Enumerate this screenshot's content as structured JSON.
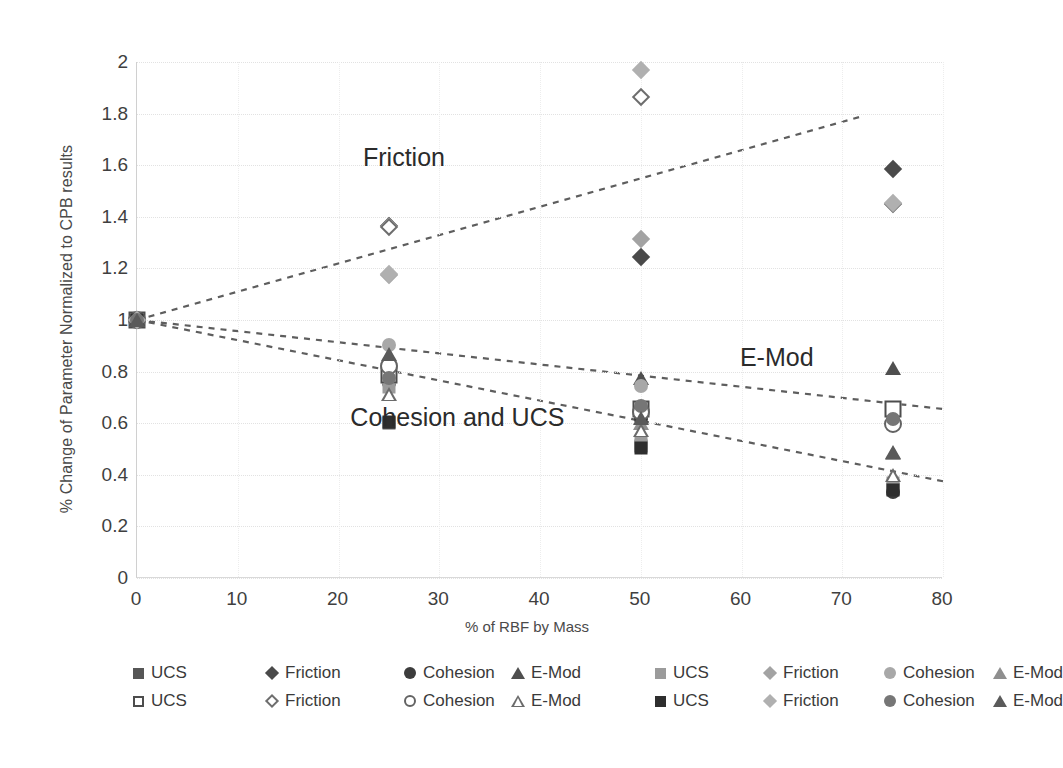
{
  "chart_data": {
    "type": "scatter",
    "title": "",
    "xlabel": "% of RBF by Mass",
    "ylabel": "% Change of Parameter Normalized to CPB results",
    "xlim": [
      0,
      80
    ],
    "ylim": [
      0,
      2
    ],
    "xticks": [
      0,
      10,
      20,
      30,
      40,
      50,
      60,
      70,
      80
    ],
    "yticks": [
      0,
      0.2,
      0.4,
      0.6,
      0.8,
      1,
      1.2,
      1.4,
      1.6,
      1.8,
      2
    ],
    "xtick_labels": [
      "0",
      "10",
      "20",
      "30",
      "40",
      "50",
      "60",
      "70",
      "80"
    ],
    "ytick_labels": [
      "0",
      "0.2",
      "0.4",
      "0.6",
      "0.8",
      "1",
      "1.2",
      "1.4",
      "1.6",
      "1.8",
      "2"
    ],
    "grid": true,
    "legend_position": "bottom",
    "annotations": [
      {
        "text": "Friction",
        "x": 26.5,
        "y": 1.63
      },
      {
        "text": "E-Mod",
        "x": 63.5,
        "y": 0.855
      },
      {
        "text": "Cohesion and UCS",
        "x": 31.8,
        "y": 0.625
      }
    ],
    "trendlines": [
      {
        "name": "Friction trend",
        "x": [
          0,
          72
        ],
        "y": [
          1.0,
          1.79
        ],
        "style": "dashed",
        "color": "#5e5e5e"
      },
      {
        "name": "E-Mod trend",
        "x": [
          0,
          80
        ],
        "y": [
          1.0,
          0.655
        ],
        "style": "dashed",
        "color": "#5e5e5e"
      },
      {
        "name": "Cohesion and UCS trend",
        "x": [
          0,
          80
        ],
        "y": [
          1.0,
          0.375
        ],
        "style": "dashed",
        "color": "#5e5e5e"
      }
    ],
    "series": [
      {
        "name": "UCS",
        "set": 1,
        "marker": "square",
        "fill": "filled",
        "color": "#565656",
        "x": [
          0,
          25,
          50,
          75
        ],
        "y": [
          1.0,
          0.6,
          0.51,
          0.345
        ]
      },
      {
        "name": "Friction",
        "set": 1,
        "marker": "diamond",
        "fill": "filled",
        "color": "#4a4a4a",
        "x": [
          0,
          25,
          50,
          75
        ],
        "y": [
          1.0,
          1.365,
          1.245,
          1.585
        ]
      },
      {
        "name": "Cohesion",
        "set": 1,
        "marker": "circle",
        "fill": "filled",
        "color": "#3c3c3c",
        "x": [
          0,
          25,
          50,
          75
        ],
        "y": [
          1.0,
          0.755,
          0.615,
          0.335
        ]
      },
      {
        "name": "E-Mod",
        "set": 1,
        "marker": "triangle",
        "fill": "filled",
        "color": "#4f4f4f",
        "x": [
          0,
          25,
          50,
          75
        ],
        "y": [
          1.0,
          0.855,
          0.775,
          0.815
        ]
      },
      {
        "name": "UCS",
        "set": 2,
        "marker": "square",
        "fill": "filled",
        "color": "#9b9b9b",
        "x": [
          0,
          25,
          50,
          75
        ],
        "y": [
          1.0,
          0.74,
          0.525,
          0.37
        ]
      },
      {
        "name": "Friction",
        "set": 2,
        "marker": "diamond",
        "fill": "filled",
        "color": "#a3a3a3",
        "x": [
          0,
          25,
          50,
          75
        ],
        "y": [
          1.0,
          1.175,
          1.315,
          1.45
        ]
      },
      {
        "name": "Cohesion",
        "set": 2,
        "marker": "circle",
        "fill": "filled",
        "color": "#a8a8a8",
        "x": [
          0,
          25,
          50,
          75
        ],
        "y": [
          1.0,
          0.905,
          0.745,
          0.625
        ]
      },
      {
        "name": "E-Mod",
        "set": 2,
        "marker": "triangle",
        "fill": "filled",
        "color": "#8f8f8f",
        "x": [
          0,
          25,
          50,
          75
        ],
        "y": [
          1.0,
          0.865,
          0.6,
          0.485
        ]
      },
      {
        "name": "UCS",
        "set": 3,
        "marker": "square",
        "fill": "open",
        "color": "#4d4d4d",
        "x": [
          0,
          25,
          50,
          75
        ],
        "y": [
          1.0,
          0.785,
          0.655,
          0.655
        ]
      },
      {
        "name": "Friction",
        "set": 3,
        "marker": "diamond",
        "fill": "open",
        "color": "#6e6e6e",
        "x": [
          0,
          25,
          50,
          75
        ],
        "y": [
          1.0,
          1.36,
          1.865,
          1.45
        ]
      },
      {
        "name": "Cohesion",
        "set": 3,
        "marker": "circle",
        "fill": "open",
        "color": "#636363",
        "x": [
          0,
          25,
          50,
          75
        ],
        "y": [
          1.0,
          0.82,
          0.645,
          0.595
        ]
      },
      {
        "name": "E-Mod",
        "set": 3,
        "marker": "triangle",
        "fill": "open",
        "color": "#6b6b6b",
        "x": [
          0,
          25,
          50,
          75
        ],
        "y": [
          1.0,
          0.715,
          0.575,
          0.4
        ]
      },
      {
        "name": "UCS",
        "set": 4,
        "marker": "square",
        "fill": "filled",
        "color": "#2e2e2e",
        "x": [
          0,
          25,
          50,
          75
        ],
        "y": [
          1.0,
          0.605,
          0.505,
          0.34
        ]
      },
      {
        "name": "Friction",
        "set": 4,
        "marker": "diamond",
        "fill": "filled",
        "color": "#b0b0b0",
        "x": [
          0,
          25,
          50,
          75
        ],
        "y": [
          1.0,
          1.18,
          1.97,
          1.455
        ]
      },
      {
        "name": "Cohesion",
        "set": 4,
        "marker": "circle",
        "fill": "filled",
        "color": "#767676",
        "x": [
          0,
          25,
          50,
          75
        ],
        "y": [
          1.0,
          0.775,
          0.665,
          0.615
        ]
      },
      {
        "name": "E-Mod",
        "set": 4,
        "marker": "triangle",
        "fill": "filled",
        "color": "#5a5a5a",
        "x": [
          0,
          25,
          50,
          75
        ],
        "y": [
          1.0,
          0.87,
          0.62,
          0.49
        ]
      }
    ],
    "legend": {
      "row1": [
        {
          "label": "UCS",
          "marker": "square",
          "fill": "filled",
          "color": "#565656"
        },
        {
          "label": "Friction",
          "marker": "diamond",
          "fill": "filled",
          "color": "#4a4a4a"
        },
        {
          "label": "Cohesion",
          "marker": "circle",
          "fill": "filled",
          "color": "#3c3c3c"
        },
        {
          "label": "E-Mod",
          "marker": "triangle",
          "fill": "filled",
          "color": "#4f4f4f"
        },
        {
          "label": "UCS",
          "marker": "square",
          "fill": "filled",
          "color": "#9b9b9b"
        },
        {
          "label": "Friction",
          "marker": "diamond",
          "fill": "filled",
          "color": "#a3a3a3"
        },
        {
          "label": "Cohesion",
          "marker": "circle",
          "fill": "filled",
          "color": "#a8a8a8"
        },
        {
          "label": "E-Mod",
          "marker": "triangle",
          "fill": "filled",
          "color": "#8f8f8f"
        }
      ],
      "row2": [
        {
          "label": "UCS",
          "marker": "square",
          "fill": "open",
          "color": "#4d4d4d"
        },
        {
          "label": "Friction",
          "marker": "diamond",
          "fill": "open",
          "color": "#6e6e6e"
        },
        {
          "label": "Cohesion",
          "marker": "circle",
          "fill": "open",
          "color": "#636363"
        },
        {
          "label": "E-Mod",
          "marker": "triangle",
          "fill": "open",
          "color": "#6b6b6b"
        },
        {
          "label": "UCS",
          "marker": "square",
          "fill": "filled",
          "color": "#2e2e2e"
        },
        {
          "label": "Friction",
          "marker": "diamond",
          "fill": "filled",
          "color": "#b0b0b0"
        },
        {
          "label": "Cohesion",
          "marker": "circle",
          "fill": "filled",
          "color": "#767676"
        },
        {
          "label": "E-Mod",
          "marker": "triangle",
          "fill": "filled",
          "color": "#5a5a5a"
        }
      ]
    }
  },
  "caption": {
    "line1": ""
  }
}
